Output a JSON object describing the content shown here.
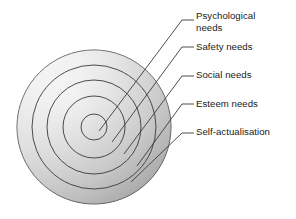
{
  "diagram": {
    "type": "concentric-circles",
    "center": {
      "x": 94,
      "y": 127
    },
    "background_color": "#ffffff",
    "stroke_color": "#3a3a3a",
    "gradient": {
      "light": "#fdfdfd",
      "mid": "#d9d9d9",
      "dark": "#9a9a9a"
    },
    "rings": [
      {
        "name": "self-actualisation",
        "radius": 77,
        "order": 5
      },
      {
        "name": "esteem-needs",
        "radius": 62,
        "order": 4
      },
      {
        "name": "social-needs",
        "radius": 47,
        "order": 3
      },
      {
        "name": "safety-needs",
        "radius": 31,
        "order": 2
      },
      {
        "name": "psychological-needs",
        "radius": 13,
        "order": 1
      }
    ],
    "labels": [
      {
        "id": "psychological",
        "text": "Psychological\nneeds",
        "line_y": 20,
        "anchor_x": 112,
        "anchor_y": 118
      },
      {
        "id": "safety",
        "text": "Safety needs",
        "line_y": 47,
        "anchor_x": 124,
        "anchor_y": 130
      },
      {
        "id": "social",
        "text": "Social needs",
        "line_y": 76,
        "anchor_x": 136,
        "anchor_y": 142
      },
      {
        "id": "esteem",
        "text": "Esteem needs",
        "line_y": 104,
        "anchor_x": 148,
        "anchor_y": 155
      },
      {
        "id": "self",
        "text": "Self-actualisation",
        "line_y": 133,
        "anchor_x": 160,
        "anchor_y": 172
      }
    ],
    "leader_line": {
      "horizontal_start_x": 182,
      "horizontal_end_x": 194,
      "color": "#3a3a3a",
      "width": 0.9
    }
  }
}
